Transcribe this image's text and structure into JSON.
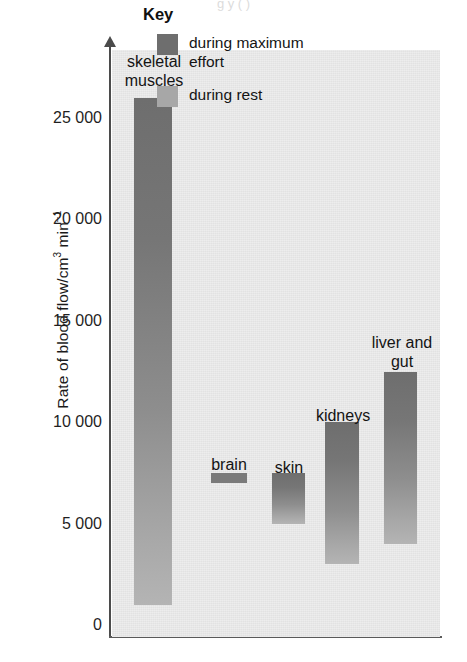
{
  "figure": {
    "top_caption_fragment": "g  y  (  )"
  },
  "chart_data": {
    "type": "bar",
    "subtype": "floating-range-bar",
    "title": "",
    "xlabel": "",
    "ylabel": "Rate of blood flow/cm³ min⁻¹",
    "ylabel_parts": {
      "main": "Rate of blood flow/cm",
      "sup1": "3",
      "mid": " min",
      "sup2": "−1"
    },
    "ylim": [
      0,
      29000
    ],
    "yticks": [
      0,
      5000,
      10000,
      15000,
      20000,
      25000
    ],
    "ytick_labels": [
      "0",
      "5 000",
      "10 000",
      "15 000",
      "20 000",
      "25 000"
    ],
    "grid": false,
    "categories": [
      "skeletal muscles",
      "brain",
      "skin",
      "kidneys",
      "liver and gut"
    ],
    "bars": [
      {
        "label": "skeletal\nmuscles",
        "rest": 1000,
        "max_effort": 26000
      },
      {
        "label": "brain",
        "rest": 7000,
        "max_effort": 7500
      },
      {
        "label": "skin",
        "rest": 5000,
        "max_effort": 7500
      },
      {
        "label": "kidneys",
        "rest": 3000,
        "max_effort": 10000
      },
      {
        "label": "liver and\ngut",
        "rest": 4000,
        "max_effort": 12500
      }
    ],
    "series": [
      {
        "name": "during maximum effort",
        "values": [
          26000,
          7500,
          7500,
          10000,
          12500
        ]
      },
      {
        "name": "during rest",
        "values": [
          1000,
          7000,
          5000,
          3000,
          4000
        ]
      }
    ],
    "legend_position": "inside-top-right"
  },
  "legend": {
    "title": "Key",
    "entries": [
      {
        "label": "during maximum effort",
        "color": "#6e6e6e"
      },
      {
        "label": "during rest",
        "color": "#a7a7a7"
      }
    ]
  },
  "colors": {
    "plot_background": "#e9e9e9",
    "bar_top_dark": "#6e6e6e",
    "bar_bottom_light": "#b4b4b4",
    "axis": "#4b4b4b",
    "text": "#141414"
  },
  "bar_labels": {
    "skeletal_muscles": "skeletal\nmuscles",
    "brain": "brain",
    "skin": "skin",
    "kidneys": "kidneys",
    "liver_and_gut": "liver and\ngut"
  }
}
